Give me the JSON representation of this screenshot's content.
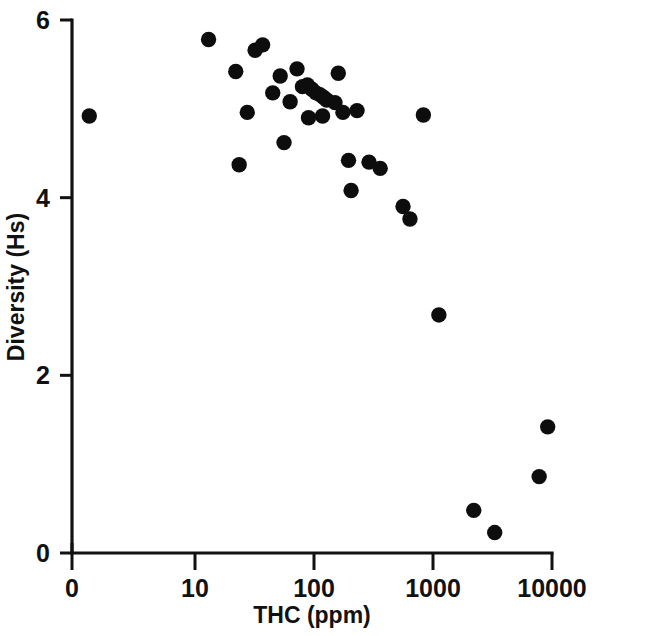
{
  "figure": {
    "background_color": "#ffffff",
    "ink_color": "#111111"
  },
  "chart_data": {
    "type": "scatter",
    "title": "",
    "subtitle": "",
    "xlabel": "THC (ppm)",
    "ylabel": "Diversity (Hs)",
    "xscale": "log",
    "yscale": "linear",
    "x_break_note": "axis origin labelled 0, then logarithmic decades from 10",
    "xlim": [
      10,
      10000
    ],
    "ylim": [
      0,
      6
    ],
    "xticks": [
      0,
      10,
      100,
      1000,
      10000
    ],
    "xticklabels": [
      "0",
      "10",
      "100",
      "1000",
      "10000"
    ],
    "yticks": [
      0,
      2,
      4,
      6
    ],
    "yticklabels": [
      "0",
      "2",
      "4",
      "6"
    ],
    "grid": false,
    "legend": null,
    "marker": {
      "shape": "circle",
      "color": "#0d0d0d",
      "size_px": 9
    },
    "points": [
      {
        "x": 1.8,
        "y": 4.92
      },
      {
        "x": 13.0,
        "y": 5.78
      },
      {
        "x": 22.0,
        "y": 5.42
      },
      {
        "x": 23.5,
        "y": 4.37
      },
      {
        "x": 27.5,
        "y": 4.96
      },
      {
        "x": 32.0,
        "y": 5.66
      },
      {
        "x": 37.0,
        "y": 5.72
      },
      {
        "x": 45.0,
        "y": 5.18
      },
      {
        "x": 52.0,
        "y": 5.37
      },
      {
        "x": 56.0,
        "y": 4.62
      },
      {
        "x": 63.0,
        "y": 5.08
      },
      {
        "x": 72.0,
        "y": 5.45
      },
      {
        "x": 80.0,
        "y": 5.25
      },
      {
        "x": 88.0,
        "y": 5.27
      },
      {
        "x": 96.0,
        "y": 5.22
      },
      {
        "x": 104.0,
        "y": 5.18
      },
      {
        "x": 112.0,
        "y": 5.16
      },
      {
        "x": 120.0,
        "y": 5.13
      },
      {
        "x": 118.0,
        "y": 4.92
      },
      {
        "x": 128.0,
        "y": 5.1
      },
      {
        "x": 90.0,
        "y": 4.9
      },
      {
        "x": 150.0,
        "y": 5.07
      },
      {
        "x": 160.0,
        "y": 5.4
      },
      {
        "x": 175.0,
        "y": 4.96
      },
      {
        "x": 195.0,
        "y": 4.42
      },
      {
        "x": 205.0,
        "y": 4.08
      },
      {
        "x": 230.0,
        "y": 4.98
      },
      {
        "x": 290.0,
        "y": 4.4
      },
      {
        "x": 360.0,
        "y": 4.33
      },
      {
        "x": 560.0,
        "y": 3.9
      },
      {
        "x": 640.0,
        "y": 3.76
      },
      {
        "x": 830.0,
        "y": 4.93
      },
      {
        "x": 1120.0,
        "y": 2.68
      },
      {
        "x": 2200.0,
        "y": 0.48
      },
      {
        "x": 3300.0,
        "y": 0.23
      },
      {
        "x": 7800.0,
        "y": 0.86
      },
      {
        "x": 9200.0,
        "y": 1.42
      }
    ]
  }
}
